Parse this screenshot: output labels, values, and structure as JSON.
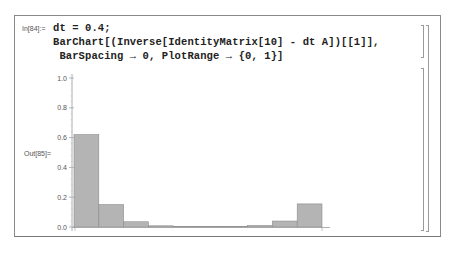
{
  "notebook": {
    "input_label": "In[84]:=",
    "output_label": "Out[85]=",
    "input_lines": [
      "dt = 0.4;",
      "BarChart[(Inverse[IdentityMatrix[10] - dt A])[[1]],",
      " BarSpacing → 0, PlotRange → {0, 1}]"
    ]
  },
  "colors": {
    "bar_fill": "#b4b4b4",
    "bar_stroke": "#8c8c8c",
    "axis": "#9a9a9a",
    "frame": "#8a8a8a"
  },
  "chart_data": {
    "type": "bar",
    "title": "",
    "xlabel": "",
    "ylabel": "",
    "categories": [
      "1",
      "2",
      "3",
      "4",
      "5",
      "6",
      "7",
      "8",
      "9",
      "10"
    ],
    "values": [
      0.62,
      0.15,
      0.035,
      0.008,
      0.001,
      0.0005,
      0.002,
      0.01,
      0.04,
      0.155
    ],
    "ylim": [
      0,
      1
    ],
    "yticks": [
      "0.0",
      "0.2",
      "0.4",
      "0.6",
      "0.8",
      "1.0"
    ],
    "grid": false,
    "bar_spacing": 0
  }
}
